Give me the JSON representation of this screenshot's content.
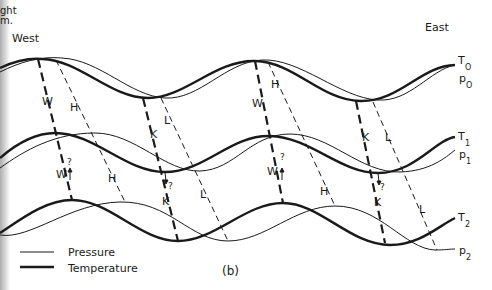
{
  "figure": {
    "panel_label": "(b)",
    "cropped_header": [
      "ght",
      "m."
    ],
    "direction_left": "West",
    "direction_right": "East"
  },
  "legend": {
    "items": [
      {
        "label": "Pressure",
        "style": "thin"
      },
      {
        "label": "Temperature",
        "style": "thick"
      }
    ]
  },
  "curves": [
    {
      "id": "T0",
      "label": "T",
      "sub": "O",
      "kind": "temperature",
      "level": 0
    },
    {
      "id": "p0",
      "label": "p",
      "sub": "O",
      "kind": "pressure",
      "level": 0
    },
    {
      "id": "T1",
      "label": "T",
      "sub": "1",
      "kind": "temperature",
      "level": 1
    },
    {
      "id": "p1",
      "label": "p",
      "sub": "1",
      "kind": "pressure",
      "level": 1
    },
    {
      "id": "T2",
      "label": "T",
      "sub": "2",
      "kind": "temperature",
      "level": 2
    },
    {
      "id": "p2",
      "label": "p",
      "sub": "2",
      "kind": "pressure",
      "level": 2
    }
  ],
  "axis_labels": {
    "W": "W",
    "W_q": "W",
    "H": "H",
    "K": "K",
    "K_q": "K",
    "L": "L",
    "q": "?"
  },
  "colors": {
    "ink": "#1a1a1a",
    "background": "#ffffff"
  }
}
